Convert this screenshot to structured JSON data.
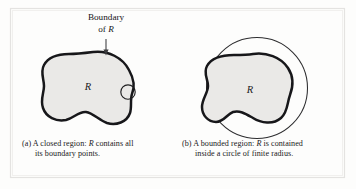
{
  "figure": {
    "background_color": "#fdfdfc",
    "frame_color": "#e3e3e1",
    "blob_fill": "#e9e8e6",
    "blob_stroke": "#1a1a1a",
    "thin_stroke": "#2b2b2b",
    "annotation": {
      "line1": "Boundary",
      "line2_prefix": "of ",
      "line2_symbol": "R",
      "arrow_name": "pointer-arrow"
    },
    "panel_a": {
      "region_label": "R",
      "caption_line1": "(a) A closed region: R contains all",
      "caption_line1_pre": "(a) A closed region: ",
      "caption_line1_sym": "R",
      "caption_line1_post": " contains all",
      "caption_line2": "its boundary points."
    },
    "panel_b": {
      "region_label": "R",
      "caption_line1_pre": "(b) A bounded region: ",
      "caption_line1_sym": "R",
      "caption_line1_post": " is contained",
      "caption_line2": "inside a circle of finite radius."
    }
  }
}
